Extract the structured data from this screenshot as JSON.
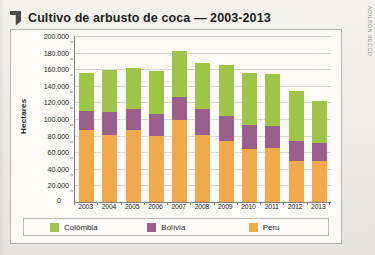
{
  "page": {
    "title": "Cultivo de arbusto de coca — 2003-2013",
    "flag_icon": "flag-bookmark-icon",
    "credit": "ADILSON SECCO"
  },
  "chart_data": {
    "type": "bar",
    "stacked": true,
    "title": "Cultivo de arbusto de coca — 2003-2013",
    "xlabel": "",
    "ylabel": "Hectares",
    "ylim": [
      0,
      200000
    ],
    "ytick_step": 20000,
    "grid": true,
    "legend_position": "bottom",
    "categories": [
      "2003",
      "2004",
      "2005",
      "2006",
      "2007",
      "2008",
      "2009",
      "2010",
      "2011",
      "2012",
      "2013"
    ],
    "ytick_labels": [
      "200.000",
      "180.000",
      "160.000",
      "140.000",
      "120.000",
      "100.000",
      "80.000",
      "60.000",
      "40.000",
      "20.000"
    ],
    "zero_label": "0",
    "series": [
      {
        "name": "Colômbia",
        "color": "#9ec44a",
        "values": [
          45000,
          51000,
          49000,
          52000,
          55000,
          56000,
          61000,
          62000,
          63000,
          60000,
          51000
        ]
      },
      {
        "name": "Bolívia",
        "color": "#9b5f8c",
        "values": [
          23000,
          27000,
          25000,
          27000,
          28000,
          31000,
          31000,
          29000,
          26000,
          25000,
          22000
        ]
      },
      {
        "name": "Peru",
        "color": "#f0a94c",
        "values": [
          87000,
          81000,
          87000,
          79000,
          99000,
          81000,
          73000,
          64000,
          65000,
          49000,
          49000
        ]
      }
    ],
    "totals": [
      155000,
      159000,
      161000,
      158000,
      182000,
      168000,
      165000,
      155000,
      154000,
      134000,
      122000
    ]
  }
}
